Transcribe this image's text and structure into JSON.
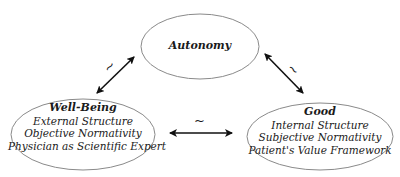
{
  "diagram": {
    "nodes": {
      "autonomy": {
        "title": "Autonomy",
        "lines": []
      },
      "well_being": {
        "title": "Well-Being",
        "lines": [
          "External Structure",
          "Objective Normativity",
          "Physician as Scientific Expert"
        ]
      },
      "good": {
        "title": "Good",
        "lines": [
          "Internal Structure",
          "Subjective Normativity",
          "Patient's Value Framework"
        ]
      }
    },
    "edges": [
      {
        "from": "well_being",
        "to": "autonomy",
        "label": "~",
        "type": "bidirectional"
      },
      {
        "from": "autonomy",
        "to": "good",
        "label": "~",
        "type": "bidirectional"
      },
      {
        "from": "well_being",
        "to": "good",
        "label": "~",
        "type": "bidirectional"
      }
    ],
    "colors": {
      "stroke": "#8a8a8a",
      "arrow": "#111111",
      "text": "#1a1a1a",
      "background": "#ffffff"
    }
  }
}
